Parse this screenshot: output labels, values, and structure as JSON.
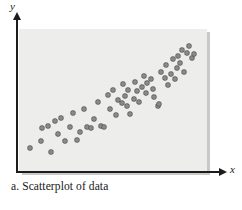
{
  "figure": {
    "caption": "a. Scatterplot of data",
    "panel_color": "#ededeb",
    "axis_color": "#1c1c1c",
    "point_color": "#8a8a8a"
  },
  "axes": {
    "x_label": "x",
    "y_label": "y"
  },
  "chart_data": {
    "type": "scatter",
    "title": "",
    "subtitle": "",
    "xlabel": "x",
    "ylabel": "y",
    "grid": false,
    "legend": "none",
    "xlim": [
      0,
      100
    ],
    "ylim": [
      0,
      100
    ],
    "xticks": [],
    "yticks": [],
    "annotations": [
      "a. Scatterplot of data"
    ],
    "series": [
      {
        "name": "data",
        "marker": "circle",
        "color": "#8a8a8a",
        "points": [
          [
            2,
            8
          ],
          [
            8,
            14
          ],
          [
            9,
            25
          ],
          [
            12,
            27
          ],
          [
            14,
            5
          ],
          [
            16,
            31
          ],
          [
            18,
            20
          ],
          [
            20,
            34
          ],
          [
            22,
            14
          ],
          [
            25,
            26
          ],
          [
            27,
            38
          ],
          [
            29,
            15
          ],
          [
            31,
            22
          ],
          [
            33,
            41
          ],
          [
            35,
            26
          ],
          [
            37,
            25
          ],
          [
            39,
            33
          ],
          [
            41,
            47
          ],
          [
            43,
            27
          ],
          [
            45,
            26
          ],
          [
            47,
            53
          ],
          [
            48,
            41
          ],
          [
            50,
            57
          ],
          [
            52,
            36
          ],
          [
            53,
            49
          ],
          [
            55,
            46
          ],
          [
            56,
            62
          ],
          [
            57,
            52
          ],
          [
            58,
            44
          ],
          [
            59,
            57
          ],
          [
            60,
            37
          ],
          [
            62,
            50
          ],
          [
            63,
            64
          ],
          [
            64,
            56
          ],
          [
            65,
            47
          ],
          [
            67,
            60
          ],
          [
            68,
            69
          ],
          [
            69,
            55
          ],
          [
            70,
            63
          ],
          [
            72,
            66
          ],
          [
            73,
            58
          ],
          [
            74,
            51
          ],
          [
            76,
            44
          ],
          [
            77,
            45
          ],
          [
            78,
            72
          ],
          [
            80,
            67
          ],
          [
            81,
            78
          ],
          [
            82,
            61
          ],
          [
            84,
            71
          ],
          [
            85,
            83
          ],
          [
            86,
            66
          ],
          [
            87,
            76
          ],
          [
            88,
            86
          ],
          [
            89,
            80
          ],
          [
            90,
            91
          ],
          [
            91,
            72
          ],
          [
            93,
            88
          ],
          [
            94,
            94
          ],
          [
            96,
            84
          ],
          [
            97,
            87
          ]
        ]
      }
    ]
  }
}
